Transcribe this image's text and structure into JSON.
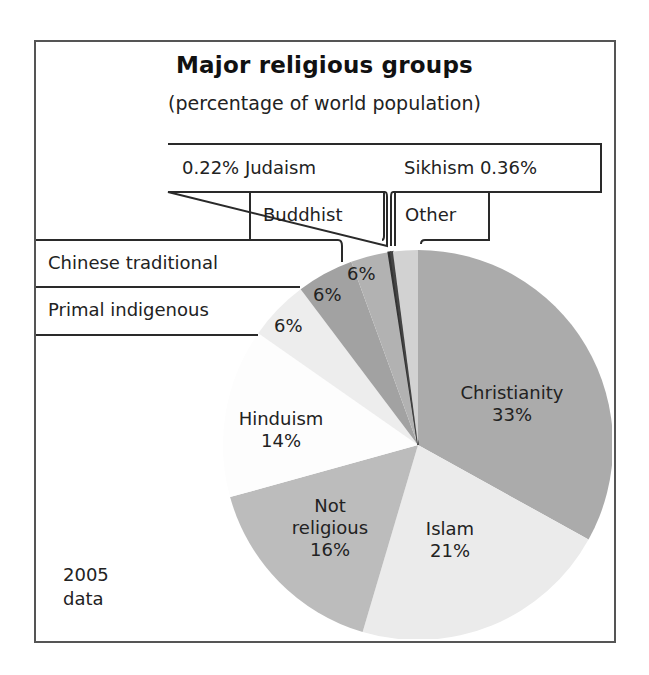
{
  "chart_data": {
    "type": "pie",
    "title": "Major religious groups",
    "subtitle": "(percentage of world population)",
    "note": "2005 data",
    "start_angle": "12 o'clock, clockwise",
    "slices": [
      {
        "label": "Christianity",
        "value": 33,
        "value_label": "33%",
        "color": "#ababab",
        "deg_start": 0,
        "deg_end": 119
      },
      {
        "label": "Islam",
        "value": 21,
        "value_label": "21%",
        "color": "#ebebeb",
        "deg_start": 119,
        "deg_end": 196.5
      },
      {
        "label": "Not religious",
        "value": 16,
        "value_label": "16%",
        "color": "#bcbcbc",
        "deg_start": 196.5,
        "deg_end": 254.5
      },
      {
        "label": "Hinduism",
        "value": 14,
        "value_label": "14%",
        "color": "#fdfdfd",
        "deg_start": 254.5,
        "deg_end": 305
      },
      {
        "label": "Primal indigenous",
        "value": 6,
        "value_label": "6%",
        "color": "#ededed",
        "deg_start": 305,
        "deg_end": 323
      },
      {
        "label": "Chinese traditional",
        "value": 6,
        "value_label": "6%",
        "color": "#a2a2a2",
        "deg_start": 323,
        "deg_end": 340
      },
      {
        "label": "Buddhist",
        "value": 6,
        "value_label": "6%",
        "color": "#b2b2b2",
        "deg_start": 340,
        "deg_end": 351.2
      },
      {
        "label": "Judaism",
        "value": 0.22,
        "value_label": "0.22%",
        "color": "#333333",
        "deg_start": 351.2,
        "deg_end": 351.9
      },
      {
        "label": "Sikhism",
        "value": 0.36,
        "value_label": "0.36%",
        "color": "#444444",
        "deg_start": 351.9,
        "deg_end": 352.6
      },
      {
        "label": "Other",
        "value": null,
        "value_label": "",
        "color": "#d2d2d2",
        "deg_start": 352.6,
        "deg_end": 360
      }
    ],
    "legend_position": "callout boxes top-left"
  },
  "labels": {
    "judaism_box": "0.22% Judaism",
    "sikhism_box": "Sikhism 0.36%",
    "buddhist_box": "Buddhist",
    "other_box": "Other",
    "chinese_box": "Chinese traditional",
    "primal_box": "Primal indigenous",
    "primal_pct": "6%",
    "chinese_pct": "6%",
    "buddhist_pct": "6%",
    "christianity_name": "Christianity",
    "christianity_pct": "33%",
    "hinduism_name": "Hinduism",
    "hinduism_pct": "14%",
    "notrel_line1": "Not",
    "notrel_line2": "religious",
    "notrel_pct": "16%",
    "islam_name": "Islam",
    "islam_pct": "21%",
    "note_line1": "2005",
    "note_line2": "data"
  }
}
